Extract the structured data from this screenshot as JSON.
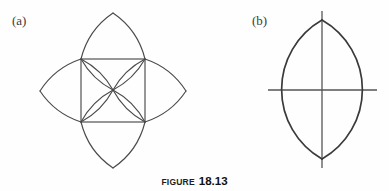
{
  "figure": {
    "caption_word": "FIGURE",
    "caption_number": "18.13",
    "background_color": "#fefefe",
    "ink_color": "#4a4a4a"
  },
  "panels": [
    {
      "label": "(a)",
      "name": "square-with-four-lens-petals",
      "description": "A square with a vesica-piscis lens petal attached outward on each of its four sides",
      "geometry": {
        "square": {
          "left": 81,
          "top": 59,
          "right": 145,
          "bottom": 122
        },
        "center": {
          "x": 113,
          "y": 90
        },
        "petal_tips": {
          "top": {
            "x": 113,
            "y": 13
          },
          "right": {
            "x": 186,
            "y": 91
          },
          "bottom": {
            "x": 113,
            "y": 168
          },
          "left": {
            "x": 40,
            "y": 91
          }
        }
      }
    },
    {
      "label": "(b)",
      "name": "vertical-lens-with-axes",
      "description": "A single vertical vesica-piscis lens crossed by a vertical and a horizontal axis line",
      "geometry": {
        "center": {
          "x": 322,
          "y": 90
        },
        "apex_top": {
          "x": 322,
          "y": 20
        },
        "apex_bottom": {
          "x": 322,
          "y": 159
        },
        "widest_left": {
          "x": 277,
          "y": 90
        },
        "widest_right": {
          "x": 367,
          "y": 90
        },
        "vertical_axis": {
          "y_start": 11,
          "y_end": 168
        },
        "horizontal_axis": {
          "x_start": 268,
          "x_end": 377
        }
      }
    }
  ]
}
